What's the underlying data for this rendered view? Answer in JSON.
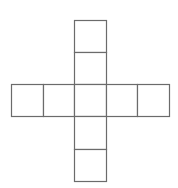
{
  "diagram": {
    "line_color": "#6b6b6b",
    "line_width": 1.2,
    "fill_color": "#ffffff",
    "cell_size": 32,
    "cells": [
      {
        "id": "top-1",
        "x": 74,
        "y": 20,
        "w": 32,
        "h": 32
      },
      {
        "id": "top-2",
        "x": 74,
        "y": 52,
        "w": 32,
        "h": 32
      },
      {
        "id": "left-1",
        "x": 11,
        "y": 84,
        "w": 32,
        "h": 32
      },
      {
        "id": "left-2",
        "x": 43,
        "y": 84,
        "w": 31,
        "h": 32
      },
      {
        "id": "center",
        "x": 74,
        "y": 84,
        "w": 32,
        "h": 32
      },
      {
        "id": "right-1",
        "x": 106,
        "y": 84,
        "w": 31,
        "h": 32
      },
      {
        "id": "right-2",
        "x": 137,
        "y": 84,
        "w": 32,
        "h": 32
      },
      {
        "id": "bottom-1",
        "x": 74,
        "y": 116,
        "w": 32,
        "h": 33
      },
      {
        "id": "bottom-2",
        "x": 74,
        "y": 149,
        "w": 32,
        "h": 32
      }
    ]
  }
}
